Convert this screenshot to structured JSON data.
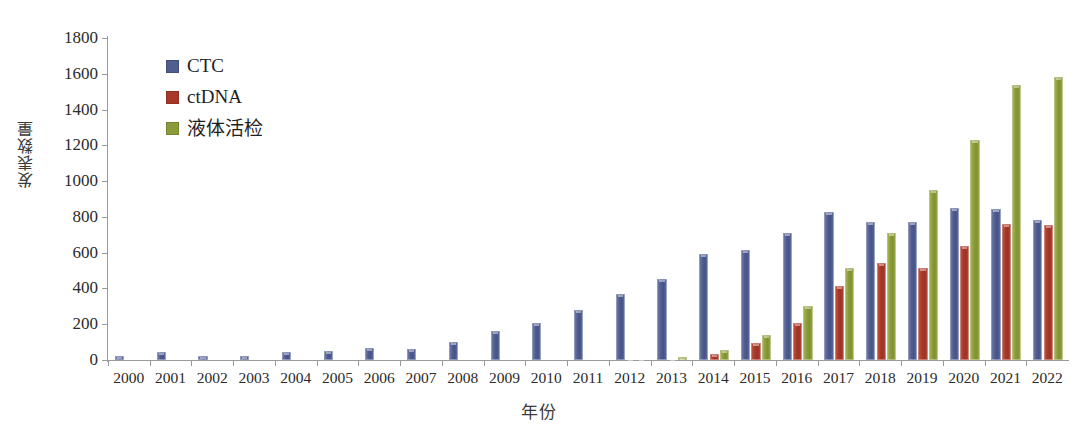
{
  "chart_data": {
    "type": "bar",
    "title": "",
    "xlabel": "年份",
    "ylabel": "发表数量",
    "ylim": [
      0,
      1800
    ],
    "ytick_step": 200,
    "grid": false,
    "legend_position": "top-left",
    "categories": [
      "2000",
      "2001",
      "2002",
      "2003",
      "2004",
      "2005",
      "2006",
      "2007",
      "2008",
      "2009",
      "2010",
      "2011",
      "2012",
      "2013",
      "2014",
      "2015",
      "2016",
      "2017",
      "2018",
      "2019",
      "2020",
      "2021",
      "2022"
    ],
    "series": [
      {
        "name": "CTC",
        "color": "#4f5d8f",
        "values": [
          25,
          45,
          25,
          25,
          45,
          50,
          65,
          62,
          100,
          160,
          205,
          280,
          370,
          455,
          595,
          615,
          710,
          825,
          770,
          770,
          850,
          845,
          780
        ]
      },
      {
        "name": "ctDNA",
        "color": "#a8392a",
        "values": [
          0,
          0,
          0,
          0,
          0,
          0,
          0,
          0,
          0,
          0,
          0,
          0,
          10,
          12,
          35,
          95,
          205,
          415,
          540,
          515,
          635,
          760,
          755
        ]
      },
      {
        "name": "液体活检",
        "color": "#8a9b3a",
        "values": [
          0,
          0,
          0,
          0,
          0,
          0,
          0,
          0,
          0,
          0,
          0,
          0,
          12,
          15,
          55,
          140,
          300,
          515,
          710,
          950,
          1230,
          1540,
          1580
        ]
      }
    ],
    "ytick_labels": [
      "1800",
      "1600",
      "1400",
      "1200",
      "1000",
      "800",
      "600",
      "400",
      "200",
      "0"
    ],
    "ytick_values": [
      1800,
      1600,
      1400,
      1200,
      1000,
      800,
      600,
      400,
      200,
      0
    ]
  },
  "legend": {
    "items": [
      {
        "label": "CTC",
        "color": "#4f5d8f"
      },
      {
        "label": "ctDNA",
        "color": "#a8392a"
      },
      {
        "label": "液体活检",
        "color": "#8a9b3a"
      }
    ]
  },
  "axes": {
    "y_title": "发表数量",
    "x_title": "年份"
  }
}
